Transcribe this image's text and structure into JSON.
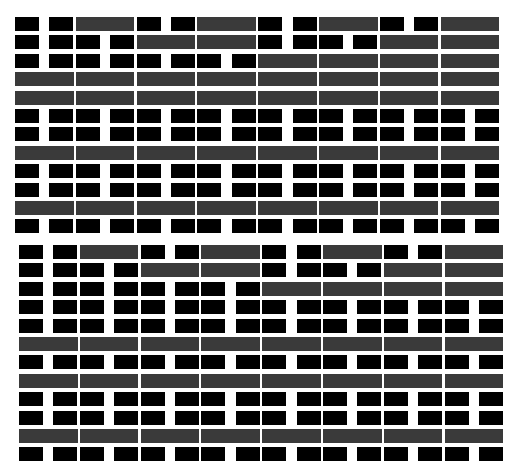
{
  "colors": {
    "black_block": "#000000",
    "gray_bar": "#3a3a3a",
    "background": "#ffffff"
  },
  "grid": {
    "half_cell_pitch": 30.4,
    "block_width": 24,
    "bar_width": 58.5,
    "row_height": 14
  },
  "panels": [
    {
      "name": "top-panel",
      "x": 15,
      "y": 17,
      "row_pitch": 18.4,
      "rows": [
        "bbGbbGbbGbbG",
        "bbbbGGbbbbGG",
        "bbbbbbbbGGGG",
        "GGGGGGGG",
        "GGGGGGGG",
        "bbbbbbbbbbbbbbbb",
        "bbbbbbbbbbbbbbbb",
        "GGGGGGGG",
        "bbbbbbbbbbbbbbbb",
        "bbbbbbbbbbbbbbbb",
        "GGGGGGGG",
        "bbbbbbbbbbbbbbbb"
      ]
    },
    {
      "name": "bottom-panel",
      "x": 19,
      "y": 245,
      "row_pitch": 18.4,
      "rows": [
        "bbGbbGbbGbbG",
        "bbbbGGbbbbGG",
        "bbbbbbbbGGGG",
        "bbbbbbbbbbbbbbbb",
        "bbbbbbbbbbbbbbbb",
        "GGGGGGGG",
        "bbbbbbbbbbbbbbbb",
        "GGGGGGGG",
        "bbbbbbbbbbbbbbbb",
        "bbbbbbbbbbbbbbbb",
        "GGGGGGGG",
        "bbbbbbbbbbbbbbbb"
      ]
    }
  ]
}
